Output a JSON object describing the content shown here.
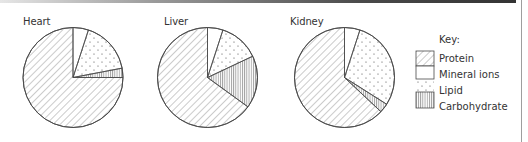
{
  "chart_data": {
    "type": "pie",
    "title": "",
    "legend": {
      "title": "Key:",
      "position": "right",
      "entries": [
        {
          "label": "Protein",
          "pattern": "diagonal-hatch"
        },
        {
          "label": "Mineral ions",
          "pattern": "blank"
        },
        {
          "label": "Lipid",
          "pattern": "dots"
        },
        {
          "label": "Carbohydrate",
          "pattern": "vertical-lines"
        }
      ]
    },
    "slice_order": [
      "Mineral ions",
      "Lipid",
      "Carbohydrate",
      "Protein"
    ],
    "charts": [
      {
        "label": "Heart",
        "values": {
          "Mineral ions": 5,
          "Lipid": 17,
          "Carbohydrate": 3,
          "Protein": 75
        }
      },
      {
        "label": "Liver",
        "values": {
          "Mineral ions": 5,
          "Lipid": 13,
          "Carbohydrate": 17,
          "Protein": 65
        }
      },
      {
        "label": "Kidney",
        "values": {
          "Mineral ions": 5,
          "Lipid": 29,
          "Carbohydrate": 3,
          "Protein": 63
        }
      }
    ],
    "units": "percent of dry mass (estimated from slice angles)"
  },
  "pies": [
    {
      "label": "Heart"
    },
    {
      "label": "Liver"
    },
    {
      "label": "Kidney"
    }
  ],
  "key": {
    "title": "Key:",
    "items": [
      {
        "label": "Protein"
      },
      {
        "label": "Mineral ions"
      },
      {
        "label": "Lipid"
      },
      {
        "label": "Carbohydrate"
      }
    ]
  },
  "style": {
    "stroke": "#4a4a4a",
    "hatch": "#6a6a6a",
    "background": "#ffffff"
  }
}
